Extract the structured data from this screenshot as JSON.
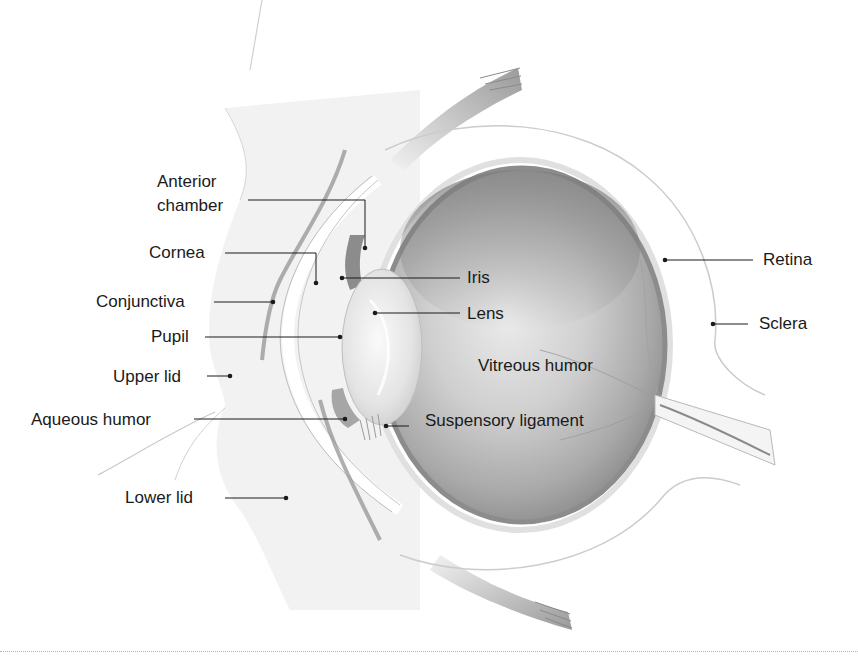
{
  "diagram": {
    "colors": {
      "background": "#ffffff",
      "eyeball_interior": "#c8c8c8",
      "eyeball_shadow": "#8e8e8e",
      "lens": "#ececec",
      "tissue": "#e6e6e6",
      "label_text": "#1a1a1a",
      "leader_line": "#1a1a1a"
    },
    "labels": {
      "anterior_chamber_line1": "Anterior",
      "anterior_chamber_line2": "chamber",
      "cornea": "Cornea",
      "conjunctiva": "Conjunctiva",
      "pupil": "Pupil",
      "upper_lid": "Upper lid",
      "aqueous_humor": "Aqueous humor",
      "lower_lid": "Lower lid",
      "iris": "Iris",
      "lens": "Lens",
      "vitreous_humor": "Vitreous humor",
      "suspensory_ligament": "Suspensory ligament",
      "retina": "Retina",
      "sclera": "Sclera"
    }
  }
}
